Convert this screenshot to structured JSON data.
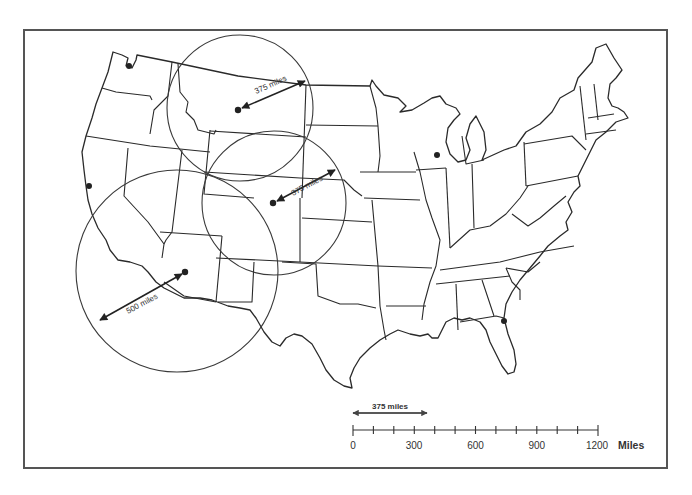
{
  "map": {
    "type": "us-map-distance-radii",
    "colors": {
      "ink": "#2a2a2a",
      "frame": "#555555",
      "background": "#ffffff"
    },
    "circles": [
      {
        "id": "montana",
        "center": [
          238,
          110
        ],
        "radius_px": 73,
        "label": "375 miles",
        "arrow_to": [
          305,
          81
        ]
      },
      {
        "id": "wyoming-colorado",
        "center": [
          273,
          203
        ],
        "radius_px": 72,
        "label": "375 miles",
        "arrow_to": [
          334,
          170
        ]
      },
      {
        "id": "arizona",
        "center": [
          185,
          272
        ],
        "radius_px": 101,
        "label": "500 miles",
        "arrow_to": [
          100,
          320
        ]
      }
    ],
    "markers": [
      {
        "id": "seattle",
        "xy": [
          129,
          67
        ]
      },
      {
        "id": "san-francisco",
        "xy": [
          89,
          186
        ]
      },
      {
        "id": "chicago",
        "xy": [
          437,
          155
        ]
      },
      {
        "id": "jacksonville",
        "xy": [
          504,
          321
        ]
      },
      {
        "id": "montana-center",
        "xy": [
          238,
          110
        ]
      },
      {
        "id": "colorado-center",
        "xy": [
          273,
          203
        ]
      },
      {
        "id": "arizona-center",
        "xy": [
          185,
          272
        ]
      }
    ],
    "labels": {
      "circle1": "375 miles",
      "circle2": "375 miles",
      "circle3": "500 miles"
    }
  },
  "scale_bar": {
    "reference_label": "375 miles",
    "ticks": [
      "0",
      "300",
      "600",
      "900",
      "1200"
    ],
    "unit": "Miles",
    "minor_divisions": 12,
    "max_miles": 1200
  }
}
